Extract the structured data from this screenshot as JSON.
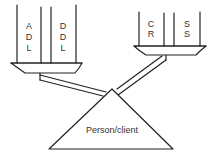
{
  "diagram": {
    "type": "balance-scale",
    "fulcrum": {
      "label": "Person/client"
    },
    "left_pan": {
      "columns": [
        {
          "letters": [
            "A",
            "D",
            "L"
          ]
        },
        {
          "letters": [
            "D",
            "D",
            "L"
          ]
        }
      ]
    },
    "right_pan": {
      "columns": [
        {
          "letters": [
            "C",
            "R"
          ]
        },
        {
          "letters": [
            "S",
            "S"
          ]
        }
      ]
    },
    "colors": {
      "line": "#222222",
      "background": "#ffffff",
      "text": "#333333"
    }
  }
}
